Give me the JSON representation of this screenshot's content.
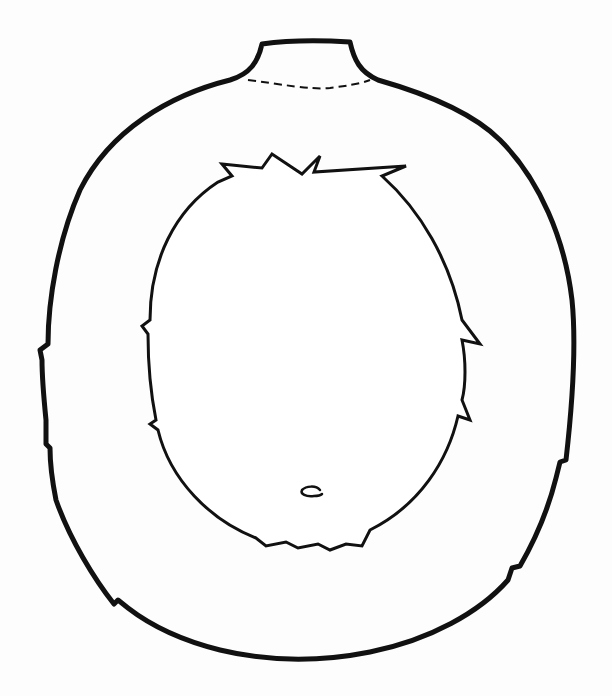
{
  "drawing": {
    "title": "Costume body outline with face cut-out",
    "description": "Black line art of a rounded body with a neck at the top, a dashed fold line under the neck, and a furry oval face opening with a small nose mark",
    "colors": {
      "stroke": "#111111",
      "background": "#fdfdfd"
    },
    "parts": [
      "outer-body-outline",
      "neck",
      "dashed-fold-line",
      "face-opening",
      "nose-mark"
    ]
  }
}
